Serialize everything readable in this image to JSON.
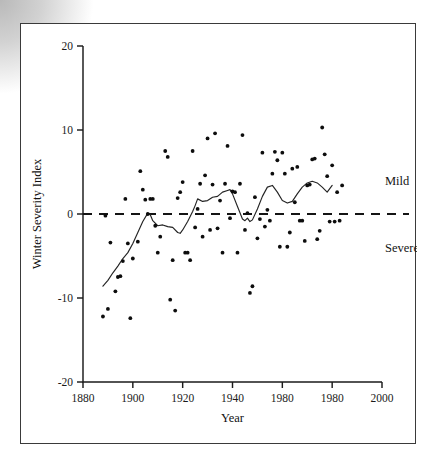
{
  "figure": {
    "title": "",
    "y_axis_title": "Winter Severity Index",
    "x_axis_title": "Year",
    "annotation_mild": "Mild",
    "annotation_severe": "Severe"
  },
  "axis": {
    "x_tick_labels": [
      "1880",
      "1900",
      "1920",
      "1940",
      "1980",
      "1980",
      "2000"
    ],
    "y_tick_labels": [
      "20",
      "10",
      "0",
      "-10",
      "-20"
    ]
  },
  "colors": {
    "point": "#0d0d0d",
    "axis": "#1b1b1b",
    "zero_line": "#141414",
    "smooth_line": "#242424",
    "frame": "#3a3a3a",
    "background": "#ffffff"
  },
  "chart_data": {
    "type": "scatter",
    "title": "",
    "xlabel": "Year",
    "ylabel": "Winter Severity Index",
    "xlim": [
      1880,
      2000
    ],
    "ylim": [
      -20,
      20
    ],
    "xticks": [
      1880,
      1900,
      1920,
      1940,
      1960,
      1980,
      2000
    ],
    "xtick_labels": [
      "1880",
      "1900",
      "1920",
      "1940",
      "1980",
      "1980",
      "2000"
    ],
    "yticks": [
      20,
      10,
      0,
      -10,
      -20
    ],
    "ytick_labels": [
      "20",
      "10",
      "0",
      "-10",
      "-20"
    ],
    "grid": false,
    "legend": false,
    "annotations": [
      {
        "text": "Mild",
        "x": 1993,
        "y": 3.9,
        "note": "label above the zero reference line"
      },
      {
        "text": "Severe",
        "x": 1993,
        "y": -4.1,
        "note": "label below the zero reference line"
      }
    ],
    "reference_lines": [
      {
        "orientation": "horizontal",
        "y": 0,
        "style": "dashed",
        "width": 2.1
      }
    ],
    "series": [
      {
        "name": "Winter Severity Index (annual)",
        "type": "scatter",
        "marker": "filled-circle",
        "points": [
          [
            1888,
            -12.2
          ],
          [
            1889,
            -0.2
          ],
          [
            1890,
            -11.3
          ],
          [
            1891,
            -3.4
          ],
          [
            1893,
            -9.2
          ],
          [
            1894,
            -7.5
          ],
          [
            1895,
            -7.4
          ],
          [
            1896,
            -5.6
          ],
          [
            1897,
            1.8
          ],
          [
            1898,
            -3.5
          ],
          [
            1899,
            -12.4
          ],
          [
            1900,
            -5.3
          ],
          [
            1902,
            -3.3
          ],
          [
            1903,
            5.1
          ],
          [
            1904,
            2.9
          ],
          [
            1905,
            1.7
          ],
          [
            1906,
            0.0
          ],
          [
            1907,
            1.8
          ],
          [
            1908,
            1.8
          ],
          [
            1909,
            -1.4
          ],
          [
            1910,
            -4.6
          ],
          [
            1911,
            -2.7
          ],
          [
            1913,
            7.5
          ],
          [
            1914,
            6.8
          ],
          [
            1915,
            -10.2
          ],
          [
            1916,
            -5.5
          ],
          [
            1917,
            -11.5
          ],
          [
            1918,
            1.9
          ],
          [
            1919,
            2.6
          ],
          [
            1920,
            3.8
          ],
          [
            1921,
            -4.6
          ],
          [
            1922,
            -4.6
          ],
          [
            1923,
            -5.5
          ],
          [
            1924,
            7.5
          ],
          [
            1925,
            -1.6
          ],
          [
            1926,
            0.6
          ],
          [
            1927,
            3.6
          ],
          [
            1928,
            -2.7
          ],
          [
            1929,
            4.6
          ],
          [
            1930,
            9.0
          ],
          [
            1931,
            -1.9
          ],
          [
            1932,
            3.5
          ],
          [
            1933,
            9.6
          ],
          [
            1934,
            -1.7
          ],
          [
            1935,
            1.6
          ],
          [
            1936,
            -4.6
          ],
          [
            1937,
            3.6
          ],
          [
            1938,
            8.1
          ],
          [
            1939,
            -0.5
          ],
          [
            1940,
            2.7
          ],
          [
            1941,
            2.6
          ],
          [
            1942,
            -4.6
          ],
          [
            1943,
            3.6
          ],
          [
            1944,
            9.4
          ],
          [
            1945,
            -1.9
          ],
          [
            1946,
            0.1
          ],
          [
            1947,
            -9.4
          ],
          [
            1948,
            -8.6
          ],
          [
            1949,
            2.0
          ],
          [
            1950,
            -2.9
          ],
          [
            1951,
            -0.6
          ],
          [
            1952,
            7.3
          ],
          [
            1953,
            -1.5
          ],
          [
            1954,
            0.5
          ],
          [
            1955,
            -0.8
          ],
          [
            1956,
            4.8
          ],
          [
            1957,
            7.4
          ],
          [
            1958,
            6.4
          ],
          [
            1959,
            -3.9
          ],
          [
            1960,
            7.3
          ],
          [
            1961,
            4.8
          ],
          [
            1962,
            -3.9
          ],
          [
            1963,
            -2.2
          ],
          [
            1964,
            5.4
          ],
          [
            1965,
            1.4
          ],
          [
            1966,
            5.6
          ],
          [
            1967,
            -0.8
          ],
          [
            1968,
            -0.8
          ],
          [
            1969,
            -3.2
          ],
          [
            1970,
            3.4
          ],
          [
            1971,
            3.5
          ],
          [
            1972,
            6.5
          ],
          [
            1973,
            6.6
          ],
          [
            1974,
            -3.0
          ],
          [
            1975,
            -2.0
          ],
          [
            1976,
            10.3
          ],
          [
            1977,
            7.1
          ],
          [
            1978,
            4.5
          ],
          [
            1979,
            -0.9
          ],
          [
            1980,
            5.8
          ],
          [
            1981,
            -0.9
          ],
          [
            1982,
            2.6
          ],
          [
            1983,
            -0.8
          ],
          [
            1984,
            3.4
          ]
        ]
      },
      {
        "name": "Smoothed trend",
        "type": "line",
        "points": [
          [
            1888,
            -8.6
          ],
          [
            1890,
            -7.9
          ],
          [
            1892,
            -7.0
          ],
          [
            1894,
            -6.2
          ],
          [
            1896,
            -5.3
          ],
          [
            1898,
            -4.6
          ],
          [
            1900,
            -3.5
          ],
          [
            1902,
            -2.2
          ],
          [
            1904,
            -0.9
          ],
          [
            1906,
            0.1
          ],
          [
            1907,
            -0.1
          ],
          [
            1908,
            -0.8
          ],
          [
            1910,
            -1.4
          ],
          [
            1912,
            -1.3
          ],
          [
            1914,
            -1.5
          ],
          [
            1916,
            -1.6
          ],
          [
            1918,
            -2.2
          ],
          [
            1919,
            -2.3
          ],
          [
            1920,
            -1.9
          ],
          [
            1922,
            -0.9
          ],
          [
            1924,
            0.3
          ],
          [
            1925,
            1.0
          ],
          [
            1926,
            1.8
          ],
          [
            1928,
            1.5
          ],
          [
            1930,
            1.6
          ],
          [
            1932,
            2.0
          ],
          [
            1934,
            2.1
          ],
          [
            1936,
            2.6
          ],
          [
            1938,
            2.8
          ],
          [
            1939,
            2.9
          ],
          [
            1940,
            2.4
          ],
          [
            1942,
            0.9
          ],
          [
            1944,
            -0.6
          ],
          [
            1945,
            -0.8
          ],
          [
            1946,
            -0.5
          ],
          [
            1947,
            -0.9
          ],
          [
            1948,
            -0.7
          ],
          [
            1950,
            0.6
          ],
          [
            1952,
            2.1
          ],
          [
            1954,
            3.2
          ],
          [
            1956,
            3.4
          ],
          [
            1958,
            2.6
          ],
          [
            1960,
            1.6
          ],
          [
            1962,
            1.3
          ],
          [
            1964,
            1.5
          ],
          [
            1966,
            2.4
          ],
          [
            1968,
            3.2
          ],
          [
            1970,
            3.7
          ],
          [
            1972,
            3.9
          ],
          [
            1974,
            3.7
          ],
          [
            1976,
            3.2
          ],
          [
            1978,
            2.6
          ],
          [
            1980,
            3.4
          ]
        ]
      }
    ]
  }
}
